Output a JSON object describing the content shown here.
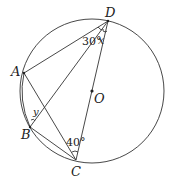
{
  "diagram": {
    "type": "geometry-circle-inscribed",
    "circle": {
      "center_label": "O",
      "cx": 92,
      "cy": 91,
      "r": 72
    },
    "points": {
      "D": {
        "label": "D",
        "x": 108,
        "y": 21
      },
      "A": {
        "label": "A",
        "x": 24,
        "y": 73
      },
      "B": {
        "label": "B",
        "x": 30,
        "y": 127
      },
      "C": {
        "label": "C",
        "x": 76,
        "y": 160
      },
      "O": {
        "label": "O",
        "x": 92,
        "y": 91
      }
    },
    "segments": [
      "AD",
      "AB",
      "AC",
      "BD",
      "BC",
      "DC"
    ],
    "angles": {
      "ADB": {
        "label": "30°",
        "vertex": "D"
      },
      "BDC": {
        "label": "x",
        "vertex": "D"
      },
      "ABD": {
        "label": "y",
        "vertex": "B"
      },
      "ACD": {
        "label": "40°",
        "vertex": "C"
      }
    }
  }
}
